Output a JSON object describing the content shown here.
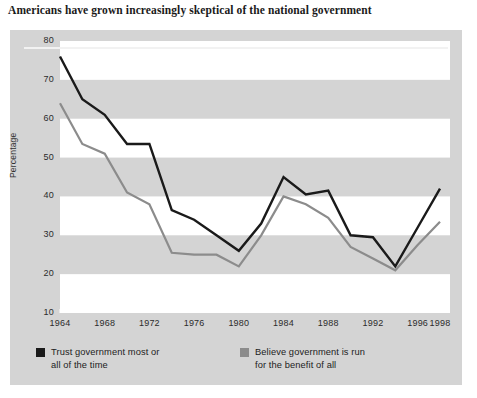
{
  "chart_data": {
    "type": "line",
    "title": "Americans have grown increasingly skeptical of the national government",
    "xlabel": "",
    "ylabel": "Percentage",
    "ylim": [
      10,
      80
    ],
    "ytick_values": [
      10,
      20,
      30,
      40,
      50,
      60,
      70,
      80
    ],
    "ytick_labels": [
      "10",
      "20",
      "30",
      "40",
      "50",
      "60",
      "70",
      "80"
    ],
    "xlim": [
      1964,
      1998
    ],
    "xtick_values": [
      1964,
      1968,
      1972,
      1976,
      1980,
      1984,
      1988,
      1992,
      1996,
      1998
    ],
    "xtick_labels": [
      "1964",
      "1968",
      "1972",
      "1976",
      "1980",
      "1984",
      "1988",
      "1992",
      "1996",
      "1998"
    ],
    "x": [
      1964,
      1966,
      1968,
      1970,
      1972,
      1974,
      1976,
      1978,
      1980,
      1982,
      1984,
      1986,
      1988,
      1990,
      1992,
      1994,
      1996,
      1998
    ],
    "grid": "horizontal-bands",
    "legend_position": "below-plot",
    "series": [
      {
        "name": "Trust government most or all of the time",
        "color": "#1a1a1a",
        "values": [
          76,
          65,
          61,
          53.5,
          53.5,
          36.5,
          34,
          30,
          26,
          33,
          45,
          40.5,
          41.5,
          30,
          29.5,
          22,
          32,
          42
        ]
      },
      {
        "name": "Believe government is run for the benefit of all",
        "color": "#8c8c8c",
        "values": [
          64,
          53.5,
          51,
          41,
          38,
          25.5,
          25,
          25,
          22,
          30,
          40,
          38,
          34.5,
          27,
          24,
          21,
          27.5,
          33.5
        ]
      }
    ]
  },
  "legend": {
    "items": [
      {
        "label": "Trust government most or\nall of the time",
        "color": "#1a1a1a",
        "swatch_name": "legend-swatch-trust"
      },
      {
        "label": "Believe government is run\nfor the benefit of all",
        "color": "#8c8c8c",
        "swatch_name": "legend-swatch-benefit"
      }
    ]
  },
  "colors": {
    "panel_background": "#d4d4d4",
    "band_background": "#ffffff",
    "series_black": "#1a1a1a",
    "series_gray": "#8c8c8c",
    "page_background": "#ffffff"
  }
}
